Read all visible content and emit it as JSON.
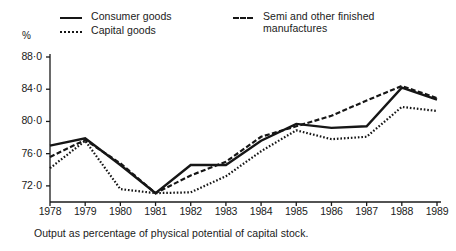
{
  "figure": {
    "unit_label": "%",
    "caption": "Output as percentage of physical potential of capital stock."
  },
  "legend": {
    "entries": [
      {
        "label": "Consumer goods",
        "style": "solid",
        "swatch": "solid-line-swatch"
      },
      {
        "label": "Capital goods",
        "style": "dotted",
        "swatch": "dotted-line-swatch"
      },
      {
        "label": "Semi and other finished\nmanufactures",
        "style": "dashed",
        "swatch": "dashed-line-swatch"
      }
    ]
  },
  "chart_data": {
    "type": "line",
    "title": "",
    "subtitle": "",
    "xlabel": "",
    "ylabel": "%",
    "annotation": "Output as percentage of physical potential of capital stock.",
    "x": [
      1978,
      1979,
      1980,
      1981,
      1982,
      1983,
      1984,
      1985,
      1986,
      1987,
      1988,
      1989
    ],
    "categories": [
      "1978",
      "1979",
      "1980",
      "1981",
      "1982",
      "1983",
      "1984",
      "1985",
      "1986",
      "1987",
      "1988",
      "1989"
    ],
    "xlim": [
      1978,
      1989
    ],
    "ylim": [
      70.0,
      88.0
    ],
    "yticks": [
      72.0,
      76.0,
      80.0,
      84.0,
      88.0
    ],
    "ytick_labels": [
      "72·0",
      "76·0",
      "80·0",
      "84·0",
      "88·0"
    ],
    "grid": false,
    "legend_position": "top",
    "series": [
      {
        "name": "Consumer goods",
        "style": "solid",
        "values": [
          77.0,
          77.9,
          74.6,
          71.1,
          74.6,
          74.6,
          77.6,
          79.7,
          79.2,
          79.4,
          84.2,
          82.7
        ]
      },
      {
        "name": "Capital goods",
        "style": "dotted",
        "values": [
          74.2,
          77.6,
          71.6,
          71.1,
          71.2,
          73.2,
          76.3,
          78.9,
          77.8,
          78.1,
          81.8,
          81.3
        ]
      },
      {
        "name": "Semi and other finished manufactures",
        "style": "dashed",
        "values": [
          75.6,
          77.7,
          74.8,
          71.1,
          73.3,
          75.0,
          78.1,
          79.4,
          80.7,
          82.6,
          84.4,
          82.9
        ]
      }
    ]
  }
}
